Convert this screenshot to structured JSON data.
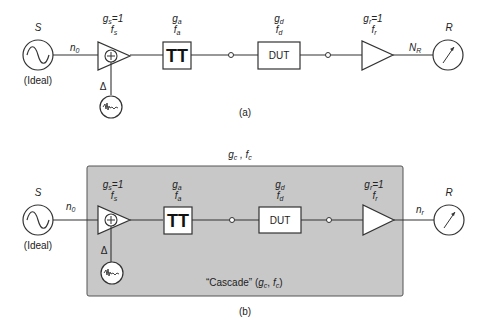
{
  "diagram_a": {
    "caption": "(a)",
    "source": {
      "label": "S",
      "sublabel": "(Ideal)"
    },
    "noise_in": {
      "symbol": "n",
      "sub": "0"
    },
    "source_amp": {
      "g": "g",
      "g_sub": "s",
      "g_val": "=1",
      "f": "f",
      "f_sub": "s",
      "delta": "Δ"
    },
    "attenuator": {
      "g": "g",
      "g_sub": "a",
      "f": "f",
      "f_sub": "a",
      "symbol": "TT"
    },
    "dut": {
      "g": "g",
      "g_sub": "d",
      "f": "f",
      "f_sub": "d",
      "label": "DUT"
    },
    "receiver_amp": {
      "g": "g",
      "g_sub": "r",
      "g_val": "=1",
      "f": "f",
      "f_sub": "r"
    },
    "noise_out": {
      "symbol": "N",
      "sub": "R"
    },
    "receiver": {
      "label": "R"
    }
  },
  "diagram_b": {
    "caption": "(b)",
    "header": {
      "g": "g",
      "g_sub": "c",
      "sep": " , ",
      "f": "f",
      "f_sub": "c"
    },
    "cascade_label": {
      "text": "“Cascade” (",
      "g": "g",
      "g_sub": "c",
      "sep": ", ",
      "f": "f",
      "f_sub": "c",
      "close": ")"
    },
    "source": {
      "label": "S",
      "sublabel": "(Ideal)"
    },
    "noise_in": {
      "symbol": "n",
      "sub": "0"
    },
    "source_amp": {
      "g": "g",
      "g_sub": "s",
      "g_val": "=1",
      "f": "f",
      "f_sub": "s",
      "delta": "Δ"
    },
    "attenuator": {
      "g": "g",
      "g_sub": "a",
      "f": "f",
      "f_sub": "a",
      "symbol": "TT"
    },
    "dut": {
      "g": "g",
      "g_sub": "d",
      "f": "f",
      "f_sub": "d",
      "label": "DUT"
    },
    "receiver_amp": {
      "g": "g",
      "g_sub": "r",
      "g_val": "=1",
      "f": "f",
      "f_sub": "r"
    },
    "noise_out": {
      "symbol": "n",
      "sub": "r"
    },
    "receiver": {
      "label": "R"
    }
  },
  "colors": {
    "cascade_fill": "#c8c8c8",
    "line": "#333333",
    "box_fill": "#ffffff"
  }
}
